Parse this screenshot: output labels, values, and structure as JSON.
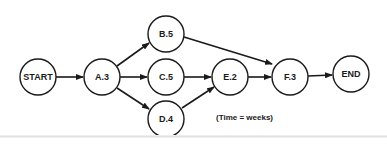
{
  "diagram": {
    "type": "activity-network",
    "nodes": [
      {
        "id": "start",
        "label": "START"
      },
      {
        "id": "a",
        "label": "A.3"
      },
      {
        "id": "b",
        "label": "B.5"
      },
      {
        "id": "c",
        "label": "C.5"
      },
      {
        "id": "d",
        "label": "D.4"
      },
      {
        "id": "e",
        "label": "E.2"
      },
      {
        "id": "f",
        "label": "F.3"
      },
      {
        "id": "end",
        "label": "END"
      }
    ],
    "edges": [
      {
        "from": "START",
        "to": "A.3"
      },
      {
        "from": "A.3",
        "to": "B.5"
      },
      {
        "from": "A.3",
        "to": "C.5"
      },
      {
        "from": "A.3",
        "to": "D.4"
      },
      {
        "from": "B.5",
        "to": "F.3"
      },
      {
        "from": "C.5",
        "to": "E.2"
      },
      {
        "from": "D.4",
        "to": "E.2"
      },
      {
        "from": "E.2",
        "to": "F.3"
      },
      {
        "from": "F.3",
        "to": "END"
      }
    ],
    "note": "(Time = weeks)",
    "colors": {
      "stroke": "#1a1a1a",
      "background": "#ffffff"
    }
  }
}
